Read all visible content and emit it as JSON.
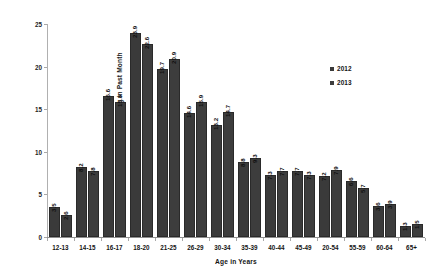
{
  "chart_data": {
    "type": "bar",
    "title": "",
    "xlabel": "Age in Years",
    "ylabel": "Percent Using in Past Month",
    "ylim": [
      0,
      25
    ],
    "yticks": [
      "0",
      "5",
      "10",
      "15",
      "20",
      "25"
    ],
    "grid": false,
    "legend_position": "right",
    "categories": [
      "12-13",
      "14-15",
      "16-17",
      "18-20",
      "21-25",
      "26-29",
      "30-34",
      "35-39",
      "40-44",
      "45-49",
      "20-54",
      "55-59",
      "60-64",
      "65+"
    ],
    "series": [
      {
        "name": "2012",
        "values": [
          3.5,
          8.2,
          16.6,
          23.9,
          19.7,
          14.6,
          13.2,
          8.8,
          7.3,
          7.7,
          7.2,
          6.6,
          3.6,
          1.3
        ],
        "labels": [
          "3.5",
          "8.2",
          "16.6",
          "23.9",
          "19.7",
          "14.6",
          "13.2",
          "8.8",
          "7.3",
          "7.7",
          "7.2",
          "6.6",
          "3.6",
          "1.3"
        ],
        "color": "#3a3a3a"
      },
      {
        "name": "2013",
        "values": [
          2.6,
          7.8,
          15.8,
          22.6,
          20.9,
          15.9,
          14.7,
          9.3,
          7.7,
          7.3,
          7.9,
          5.7,
          3.9,
          1.5
        ],
        "labels": [
          "2.6",
          "7.8",
          "15.8",
          "22.6",
          "20.9",
          "15.9",
          "14.7",
          "9.3",
          "7.7",
          "7.3",
          "7.9",
          "5.7",
          "3.9",
          "1.5"
        ],
        "color": "#3d3d3d"
      }
    ]
  },
  "legend": {
    "items": [
      {
        "label": "2012"
      },
      {
        "label": "2013"
      }
    ]
  }
}
